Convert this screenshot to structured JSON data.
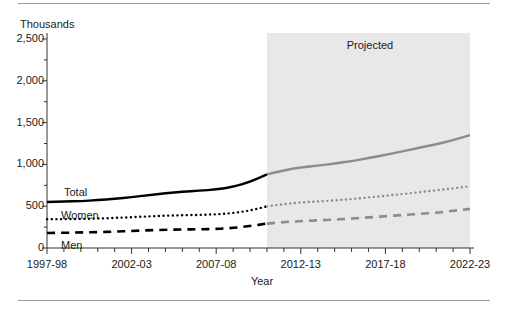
{
  "chart_data": {
    "type": "line",
    "title": "",
    "units_label": "Thousands",
    "xlabel": "Year",
    "ylabel": "",
    "ylim": [
      0,
      2500
    ],
    "ytick_values": [
      0,
      500,
      1000,
      1500,
      2000,
      2500
    ],
    "ytick_labels": [
      "0",
      "500",
      "1,000",
      "1,500",
      "2,000",
      "2,500"
    ],
    "yminor_step": 250,
    "grid": false,
    "legend_position": "inline-left",
    "x": [
      "1997-98",
      "1998-99",
      "1999-00",
      "2000-01",
      "2001-02",
      "2002-03",
      "2003-04",
      "2004-05",
      "2005-06",
      "2006-07",
      "2007-08",
      "2008-09",
      "2009-10",
      "2010-11",
      "2011-12",
      "2012-13",
      "2013-14",
      "2014-15",
      "2015-16",
      "2016-17",
      "2017-18",
      "2018-19",
      "2019-20",
      "2020-21",
      "2021-22",
      "2022-23"
    ],
    "xtick_labels": [
      "1997-98",
      "2002-03",
      "2007-08",
      "2012-13",
      "2017-18",
      "2022-23"
    ],
    "xtick_indices": [
      0,
      5,
      10,
      15,
      20,
      25
    ],
    "annotations": [
      {
        "text": "Projected",
        "start_x": "2010-11",
        "end_x": "2022-23",
        "shaded": true,
        "shade_color": "#e8e8e8"
      }
    ],
    "projection_start_x": "2010-11",
    "series": [
      {
        "name": "Total",
        "style": "solid",
        "color_actual": "#000000",
        "color_projected": "#8c8c8c",
        "values": [
          550,
          555,
          562,
          572,
          588,
          608,
          632,
          655,
          672,
          685,
          700,
          730,
          790,
          880,
          930,
          965,
          985,
          1010,
          1040,
          1075,
          1115,
          1155,
          1200,
          1240,
          1290,
          1350
        ]
      },
      {
        "name": "Women",
        "style": "dotted",
        "color_actual": "#000000",
        "color_projected": "#8c8c8c",
        "values": [
          345,
          345,
          348,
          352,
          360,
          368,
          378,
          386,
          392,
          396,
          402,
          418,
          448,
          498,
          525,
          545,
          555,
          570,
          585,
          605,
          625,
          645,
          668,
          690,
          712,
          740
        ]
      },
      {
        "name": "Men",
        "style": "dashed",
        "color_actual": "#000000",
        "color_projected": "#8c8c8c",
        "values": [
          180,
          182,
          186,
          190,
          196,
          204,
          212,
          218,
          222,
          224,
          228,
          240,
          262,
          292,
          310,
          322,
          330,
          340,
          352,
          366,
          380,
          394,
          408,
          422,
          444,
          468
        ]
      }
    ]
  },
  "series_inline_labels": [
    {
      "name": "Total",
      "x": 64,
      "y": 187
    },
    {
      "name": "Women",
      "x": 61,
      "y": 210
    },
    {
      "name": "Men",
      "x": 61,
      "y": 240
    }
  ],
  "projected_label": "Projected"
}
